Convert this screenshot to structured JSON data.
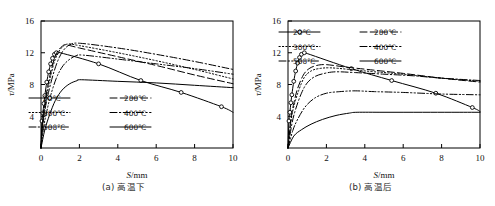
{
  "figure": {
    "panels": [
      {
        "id": "panel-a",
        "caption": "(a) 高温下",
        "axis": {
          "xlabel_italic": "S",
          "xlabel_rest": "/mm",
          "ylabel_italic": "τ",
          "ylabel_rest": "/MPa",
          "xlim": [
            0,
            10
          ],
          "ylim": [
            0,
            16
          ],
          "xticks": [
            0,
            2,
            4,
            6,
            8,
            10
          ],
          "yticks": [
            4,
            8,
            12,
            16
          ],
          "grid": false
        },
        "legend_position": "lower-left-inside"
      },
      {
        "id": "panel-b",
        "caption": "(b) 高温后",
        "axis": {
          "xlabel_italic": "S",
          "xlabel_rest": "/mm",
          "ylabel_italic": "τ",
          "ylabel_rest": "/MPa",
          "xlim": [
            0,
            10
          ],
          "ylim": [
            0,
            16
          ],
          "xticks": [
            0,
            2,
            4,
            6,
            8,
            10
          ],
          "yticks": [
            4,
            8,
            12,
            16
          ],
          "grid": false
        },
        "legend_position": "upper-inside"
      }
    ],
    "legend_entries": [
      {
        "label": "20℃",
        "style": "solid",
        "marker": "circle"
      },
      {
        "label": "200℃",
        "style": "dashed",
        "marker": "none"
      },
      {
        "label": "300℃",
        "style": "dotted",
        "marker": "none"
      },
      {
        "label": "400℃",
        "style": "dashdot",
        "marker": "none"
      },
      {
        "label": "500℃",
        "style": "dashdotdot",
        "marker": "none"
      },
      {
        "label": "600℃",
        "style": "solid",
        "marker": "none"
      }
    ]
  },
  "chart_data": [
    {
      "type": "line",
      "title": "(a) 高温下",
      "xlabel": "S/mm",
      "ylabel": "τ/MPa",
      "xlim": [
        0,
        10
      ],
      "ylim": [
        0,
        16
      ],
      "xticks": [
        0,
        2,
        4,
        6,
        8,
        10
      ],
      "yticks": [
        4,
        8,
        12,
        16
      ],
      "grid": false,
      "legend_position": "lower left (inside axes)",
      "series": [
        {
          "name": "20℃",
          "style": "solid",
          "marker": "circle",
          "x": [
            0,
            0.05,
            0.1,
            0.15,
            0.2,
            0.3,
            0.4,
            0.5,
            0.6,
            0.7,
            0.8,
            1.0,
            3.0,
            5.2,
            7.3,
            9.4,
            10.0
          ],
          "y": [
            0,
            3.4,
            4.4,
            5.6,
            6.6,
            8.3,
            9.6,
            10.6,
            11.3,
            11.8,
            12.0,
            12.0,
            10.6,
            8.5,
            7.0,
            5.2,
            4.5
          ],
          "markers_at_x": [
            0.05,
            0.1,
            0.15,
            0.2,
            0.3,
            0.4,
            0.5,
            0.6,
            0.7,
            0.8,
            3.0,
            5.2,
            7.3,
            9.4
          ]
        },
        {
          "name": "200℃",
          "style": "dashed",
          "marker": "none",
          "x": [
            0,
            0.1,
            0.2,
            0.35,
            0.5,
            0.7,
            0.9,
            1.1,
            1.3,
            2.0,
            4.0,
            6.0,
            8.0,
            10.0
          ],
          "y": [
            0,
            3.9,
            5.6,
            7.8,
            9.5,
            11.3,
            12.3,
            12.8,
            13.0,
            12.6,
            11.5,
            10.4,
            9.2,
            8.1
          ]
        },
        {
          "name": "300℃",
          "style": "dotted",
          "marker": "none",
          "x": [
            0,
            0.1,
            0.2,
            0.35,
            0.5,
            0.7,
            0.9,
            1.1,
            1.4,
            2.0,
            4.0,
            6.0,
            8.0,
            10.0
          ],
          "y": [
            0,
            3.6,
            5.2,
            7.3,
            9.0,
            10.9,
            12.0,
            12.7,
            13.1,
            12.9,
            12.0,
            11.0,
            9.9,
            8.7
          ]
        },
        {
          "name": "400℃",
          "style": "dashdot",
          "marker": "none",
          "x": [
            0,
            0.1,
            0.25,
            0.45,
            0.7,
            0.95,
            1.2,
            1.5,
            2.0,
            4.0,
            6.0,
            8.0,
            10.0
          ],
          "y": [
            0,
            3.2,
            5.4,
            7.6,
            9.8,
            11.4,
            12.4,
            13.0,
            13.2,
            12.6,
            11.8,
            10.9,
            9.9
          ]
        },
        {
          "name": "500℃",
          "style": "dashdotdot",
          "marker": "none",
          "x": [
            0,
            0.15,
            0.3,
            0.5,
            0.8,
            1.1,
            1.4,
            1.8,
            2.2,
            4.0,
            6.0,
            8.0,
            10.0
          ],
          "y": [
            0,
            2.8,
            4.6,
            6.6,
            8.8,
            10.2,
            11.0,
            11.6,
            11.7,
            11.2,
            10.6,
            10.0,
            9.3
          ]
        },
        {
          "name": "600℃",
          "style": "solid",
          "marker": "none",
          "x": [
            0,
            0.2,
            0.45,
            0.75,
            1.1,
            1.5,
            1.9,
            2.1,
            4.0,
            6.0,
            8.0,
            10.0
          ],
          "y": [
            0,
            2.3,
            4.2,
            6.0,
            7.3,
            8.1,
            8.5,
            8.6,
            8.4,
            8.2,
            7.9,
            7.6
          ]
        }
      ]
    },
    {
      "type": "line",
      "title": "(b) 高温后",
      "xlabel": "S/mm",
      "ylabel": "τ/MPa",
      "xlim": [
        0,
        10
      ],
      "ylim": [
        0,
        16
      ],
      "xticks": [
        0,
        2,
        4,
        6,
        8,
        10
      ],
      "yticks": [
        4,
        8,
        12,
        16
      ],
      "grid": false,
      "legend_position": "upper center (inside axes)",
      "series": [
        {
          "name": "20℃",
          "style": "solid",
          "marker": "circle",
          "x": [
            0,
            0.05,
            0.1,
            0.15,
            0.2,
            0.3,
            0.4,
            0.5,
            0.6,
            0.7,
            0.85,
            1.0,
            3.3,
            5.4,
            7.7,
            9.6,
            10.0
          ],
          "y": [
            0,
            3.4,
            4.5,
            5.7,
            6.7,
            8.4,
            9.7,
            10.7,
            11.4,
            11.8,
            12.0,
            11.9,
            10.0,
            8.5,
            6.9,
            5.1,
            4.6
          ],
          "markers_at_x": [
            0.05,
            0.1,
            0.15,
            0.2,
            0.3,
            0.4,
            0.5,
            0.6,
            0.7,
            0.85,
            3.3,
            5.4,
            7.7,
            9.6
          ]
        },
        {
          "name": "200℃",
          "style": "dashed",
          "marker": "none",
          "x": [
            0,
            0.15,
            0.3,
            0.5,
            0.8,
            1.1,
            1.5,
            2.0,
            3.0,
            4.5,
            6.0,
            8.0,
            10.0
          ],
          "y": [
            0,
            3.6,
            5.6,
            7.5,
            9.2,
            10.0,
            10.4,
            10.5,
            10.2,
            9.8,
            9.4,
            8.8,
            8.3
          ]
        },
        {
          "name": "300℃",
          "style": "dotted",
          "marker": "none",
          "x": [
            0,
            0.15,
            0.3,
            0.55,
            0.85,
            1.2,
            1.6,
            2.2,
            3.2,
            4.5,
            6.0,
            8.0,
            10.0
          ],
          "y": [
            0,
            3.3,
            5.2,
            7.2,
            8.9,
            9.7,
            10.0,
            10.1,
            9.9,
            9.6,
            9.3,
            8.8,
            8.4
          ]
        },
        {
          "name": "400℃",
          "style": "dashdot",
          "marker": "none",
          "x": [
            0,
            0.2,
            0.4,
            0.7,
            1.0,
            1.4,
            1.9,
            2.5,
            3.5,
            5.0,
            6.5,
            8.0,
            10.0
          ],
          "y": [
            0,
            3.0,
            4.9,
            6.9,
            8.2,
            9.0,
            9.4,
            9.6,
            9.5,
            9.3,
            9.1,
            8.8,
            8.5
          ]
        },
        {
          "name": "500℃",
          "style": "dashdotdot",
          "marker": "none",
          "x": [
            0,
            0.25,
            0.5,
            0.9,
            1.4,
            2.0,
            2.7,
            3.5,
            4.5,
            6.0,
            8.0,
            10.0
          ],
          "y": [
            0,
            2.2,
            3.6,
            5.2,
            6.3,
            6.9,
            7.1,
            7.2,
            7.1,
            7.0,
            6.8,
            6.7
          ]
        },
        {
          "name": "600℃",
          "style": "solid",
          "marker": "none",
          "x": [
            0,
            0.3,
            0.7,
            1.2,
            1.8,
            2.5,
            3.2,
            3.6,
            5.0,
            7.0,
            8.5,
            10.0
          ],
          "y": [
            0,
            1.5,
            2.3,
            3.0,
            3.6,
            4.1,
            4.4,
            4.5,
            4.5,
            4.5,
            4.5,
            4.5
          ]
        }
      ]
    }
  ]
}
